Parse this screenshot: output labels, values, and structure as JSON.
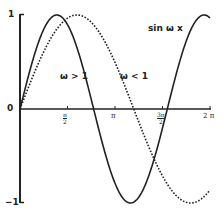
{
  "chart_data": {
    "type": "line",
    "title": "sin ω x",
    "xlabel": "",
    "ylabel": "",
    "xlim": [
      0,
      6.2832
    ],
    "ylim": [
      -1,
      1
    ],
    "grid": false,
    "x_ticks": [
      "π/2",
      "π",
      "3π/2",
      "2π"
    ],
    "x_tick_values": [
      1.5708,
      3.1416,
      4.7124,
      6.2832
    ],
    "y_ticks": [
      "1",
      "0",
      "-1"
    ],
    "y_tick_values": [
      1,
      0,
      -1
    ],
    "series": [
      {
        "name": "ω > 1",
        "style": "solid",
        "omega": 1.29,
        "x": [
          0,
          0.6,
          1.22,
          1.8,
          2.43,
          3.0,
          3.65,
          4.3,
          4.87,
          5.5,
          6.28
        ],
        "values": [
          0,
          0.7,
          1.0,
          0.68,
          0.0,
          -0.66,
          -1.0,
          -0.64,
          0.0,
          0.7,
          0.97
        ]
      },
      {
        "name": "ω < 1",
        "style": "dotted",
        "omega": 0.835,
        "x": [
          0,
          0.9,
          1.88,
          2.8,
          3.76,
          4.7,
          5.64,
          6.28
        ],
        "values": [
          0,
          0.68,
          1.0,
          0.72,
          0.0,
          -0.71,
          -1.0,
          -0.86
        ]
      }
    ],
    "annotations": [
      "sin ω x",
      "ω > 1",
      "ω < 1"
    ]
  },
  "labels": {
    "title": "sin ω x",
    "omega_gt": "ω > 1",
    "omega_lt": "ω < 1",
    "y_top": "1",
    "y_zero": "0",
    "y_bottom": "−1",
    "x_half_pi_num": "π",
    "x_half_pi_den": "2",
    "x_pi": "π",
    "x_three_half_pi_num": "3π",
    "x_three_half_pi_den": "2",
    "x_two_pi": "2 π"
  }
}
